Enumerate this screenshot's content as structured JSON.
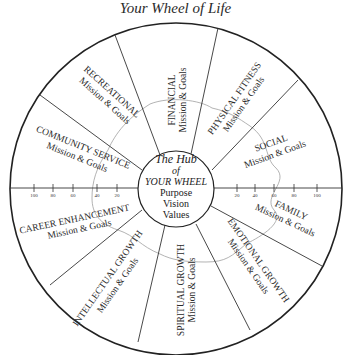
{
  "title": "Your Wheel of Life",
  "hub": {
    "title_line1": "The Hub",
    "title_line2": "of",
    "title_line3": "YOUR WHEEL",
    "items": [
      "Purpose",
      "Vision",
      "Values"
    ]
  },
  "segments": [
    {
      "name": "FINANCIAL",
      "sub": "Mission & Goals"
    },
    {
      "name": "PHYSICAL FITNESS",
      "sub": "Mission & Goals"
    },
    {
      "name": "SOCIAL",
      "sub": "Mission & Goals"
    },
    {
      "name": "FAMILY",
      "sub": "Mission & Goals"
    },
    {
      "name": "EMOTIONAL GROWTH",
      "sub": "Mission & Goals"
    },
    {
      "name": "SPIRITUAL GROWTH",
      "sub": "Mission & Goals"
    },
    {
      "name": "INTELLECTUAL GROWTH",
      "sub": "Mission & Goals"
    },
    {
      "name": "CAREER ENHANCEMENT",
      "sub": "Mission & Goals"
    },
    {
      "name": "COMMUNITY SERVICE",
      "sub": "Mission & Goals"
    },
    {
      "name": "RECREATIONAL",
      "sub": "Mission & Goals"
    }
  ],
  "scale_left": [
    "100",
    "80",
    "60",
    "40",
    "20"
  ],
  "scale_right": [
    "20",
    "40",
    "60",
    "80",
    "100"
  ],
  "colors": {
    "line": "#222222",
    "trace": "#9a9a9a"
  }
}
